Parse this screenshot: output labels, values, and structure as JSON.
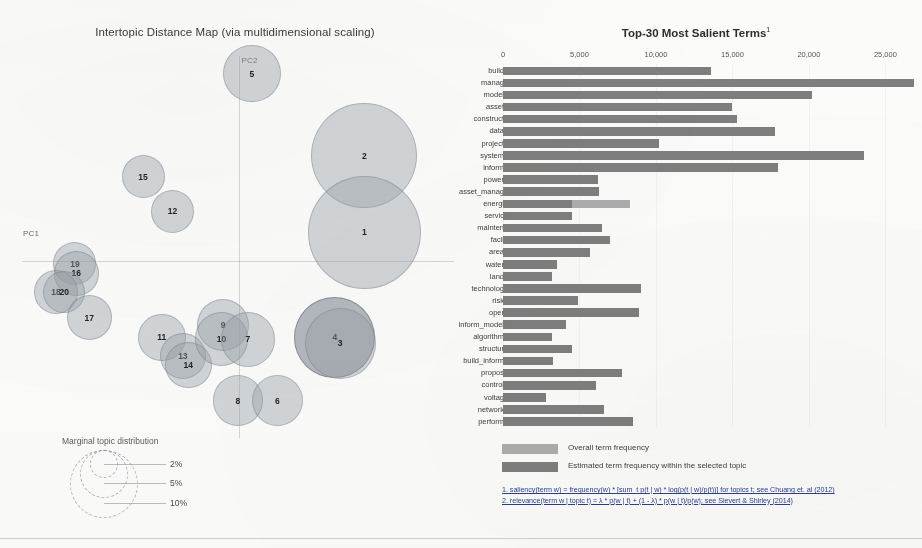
{
  "left_panel": {
    "title": "Intertopic Distance Map (via multidimensional scaling)",
    "axis_labels": {
      "x": "PC1",
      "y": "PC2"
    },
    "legend": {
      "title": "Marginal topic distribution",
      "sizes": [
        "2%",
        "5%",
        "10%"
      ]
    },
    "topics": [
      {
        "id": "2",
        "label": "2",
        "cx": 0.782,
        "cy": 0.276,
        "r": 0.118,
        "selected": false
      },
      {
        "id": "1",
        "label": "1",
        "cx": 0.782,
        "cy": 0.472,
        "r": 0.126,
        "selected": false
      },
      {
        "id": "4",
        "label": "4",
        "cx": 0.716,
        "cy": 0.742,
        "r": 0.09,
        "selected": true
      },
      {
        "id": "3",
        "label": "3",
        "cx": 0.728,
        "cy": 0.757,
        "r": 0.079,
        "selected": false
      },
      {
        "id": "5",
        "label": "5",
        "cx": 0.531,
        "cy": 0.066,
        "r": 0.064,
        "selected": false
      },
      {
        "id": "15",
        "label": "15",
        "cx": 0.288,
        "cy": 0.33,
        "r": 0.048,
        "selected": false
      },
      {
        "id": "12",
        "label": "12",
        "cx": 0.354,
        "cy": 0.418,
        "r": 0.048,
        "selected": false
      },
      {
        "id": "19",
        "label": "19",
        "cx": 0.136,
        "cy": 0.553,
        "r": 0.048,
        "selected": false
      },
      {
        "id": "16",
        "label": "16",
        "cx": 0.139,
        "cy": 0.578,
        "r": 0.05,
        "selected": false
      },
      {
        "id": "18",
        "label": "18",
        "cx": 0.094,
        "cy": 0.625,
        "r": 0.049,
        "selected": false
      },
      {
        "id": "20",
        "label": "20",
        "cx": 0.112,
        "cy": 0.625,
        "r": 0.047,
        "selected": false
      },
      {
        "id": "17",
        "label": "17",
        "cx": 0.168,
        "cy": 0.692,
        "r": 0.05,
        "selected": false
      },
      {
        "id": "11",
        "label": "11",
        "cx": 0.33,
        "cy": 0.742,
        "r": 0.053,
        "selected": false
      },
      {
        "id": "13",
        "label": "13",
        "cx": 0.377,
        "cy": 0.79,
        "r": 0.052,
        "selected": false
      },
      {
        "id": "14",
        "label": "14",
        "cx": 0.389,
        "cy": 0.813,
        "r": 0.052,
        "selected": false
      },
      {
        "id": "9",
        "label": "9",
        "cx": 0.467,
        "cy": 0.71,
        "r": 0.058,
        "selected": false
      },
      {
        "id": "10",
        "label": "10",
        "cx": 0.463,
        "cy": 0.746,
        "r": 0.06,
        "selected": false
      },
      {
        "id": "7",
        "label": "7",
        "cx": 0.522,
        "cy": 0.747,
        "r": 0.061,
        "selected": false
      },
      {
        "id": "8",
        "label": "8",
        "cx": 0.5,
        "cy": 0.904,
        "r": 0.056,
        "selected": false
      },
      {
        "id": "6",
        "label": "6",
        "cx": 0.588,
        "cy": 0.904,
        "r": 0.057,
        "selected": false
      }
    ]
  },
  "right_panel": {
    "title": "Top-30 Most Salient Terms",
    "title_superscript": "1",
    "legend": {
      "overall_label": "Overall term frequency",
      "estimated_label": "Estimated term frequency within the selected topic",
      "overall_color": "#adadad",
      "estimated_color": "#7e7e7e"
    },
    "footnotes": [
      "1. saliency(term w) = frequency(w) * [sum_t p(t | w) * log(p(t | w)/p(t))] for topics t; see Chuang et. al (2012)",
      "2. relevance(term w | topic t) = λ * p(w | t) + (1 - λ) * p(w | t)/p(w); see Sievert & Shirley (2014)"
    ]
  },
  "chart_data": {
    "type": "bar",
    "title": "Top-30 Most Salient Terms",
    "xlabel": "",
    "ylabel": "",
    "xlim": [
      0,
      27000
    ],
    "grid": false,
    "orientation": "horizontal",
    "tick_labels": [
      "0",
      "5,000",
      "10,000",
      "15,000",
      "20,000",
      "25,000"
    ],
    "tick_values": [
      0,
      5000,
      10000,
      15000,
      20000,
      25000
    ],
    "legend_position": "bottom",
    "series": [
      {
        "name": "Overall term frequency",
        "color": "#adadad"
      },
      {
        "name": "Estimated term frequency within the selected topic",
        "color": "#7e7e7e"
      }
    ],
    "categories": [
      "build",
      "manag",
      "model",
      "asset",
      "construct",
      "data",
      "project",
      "system",
      "inform",
      "power",
      "asset_manag",
      "energi",
      "servic",
      "mainten",
      "facil",
      "area",
      "water",
      "land",
      "technolog",
      "risk",
      "oper",
      "inform_model",
      "algorithm",
      "structur",
      "build_inform",
      "propos",
      "control",
      "voltag",
      "network",
      "perform"
    ],
    "overall": [
      13600,
      26900,
      20200,
      15000,
      15300,
      17800,
      10200,
      23600,
      18000,
      6200,
      6300,
      8300,
      4500,
      6500,
      7000,
      5700,
      3500,
      3200,
      9000,
      4900,
      8900,
      4100,
      3200,
      4500,
      3300,
      7800,
      6100,
      2800,
      6600,
      8500
    ],
    "estimated": [
      13600,
      26900,
      20200,
      15000,
      15300,
      17800,
      10200,
      23600,
      18000,
      6200,
      6300,
      4500,
      4500,
      6500,
      7000,
      5700,
      3500,
      3200,
      9000,
      4900,
      8900,
      4100,
      3200,
      4500,
      3300,
      7800,
      6100,
      2800,
      6600,
      8500
    ]
  }
}
